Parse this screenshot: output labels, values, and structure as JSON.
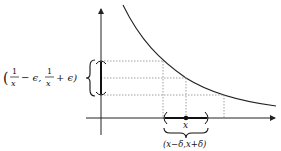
{
  "diagram": {
    "title": "",
    "function": "1/x",
    "labels": {
      "y_interval": "(1/x − ϵ, 1/x + ϵ)",
      "y_interval_parts": {
        "open": "(",
        "frac1_num": "1",
        "frac1_den": "x",
        "minus_eps": "− ϵ,",
        "frac2_num": "1",
        "frac2_den": "x",
        "plus_eps": "+ ϵ)"
      },
      "x_point": "x",
      "x_interval": "(x−δ,x+δ)"
    },
    "colors": {
      "stroke": "#222222",
      "dashed": "#888888",
      "background": "#ffffff"
    }
  }
}
